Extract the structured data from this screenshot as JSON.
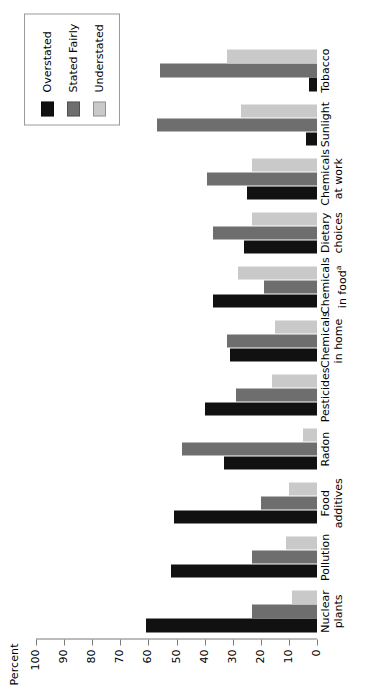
{
  "chart_data": {
    "type": "bar",
    "title": "",
    "subtitle": "",
    "xlabel": "",
    "ylabel": "Percent",
    "ylim": [
      0,
      100
    ],
    "ytick_labels": [
      "0",
      "10",
      "20",
      "30",
      "40",
      "50",
      "60",
      "70",
      "80",
      "90",
      "100"
    ],
    "ytick_values": [
      0,
      10,
      20,
      30,
      40,
      50,
      60,
      70,
      80,
      90,
      100
    ],
    "grid": false,
    "orientation": "vertical-bars-rotated-90ccw",
    "legend_position": "top-right",
    "categories": [
      "Nuclear\nplants",
      "Pollution",
      "Food\nadditives",
      "Radon",
      "Pesticides",
      "Chemicals\nin home",
      "Chemicals\nin foodᵃ",
      "Dietary\nchoices",
      "Chemicals\nat work",
      "Sunlight",
      "Tobacco"
    ],
    "category_lines": [
      [
        "Nuclear",
        "plants"
      ],
      [
        "Pollution",
        ""
      ],
      [
        "Food",
        "additives"
      ],
      [
        "Radon",
        ""
      ],
      [
        "Pesticides",
        ""
      ],
      [
        "Chemicals",
        "in home"
      ],
      [
        "Chemicals",
        "in food"
      ],
      [
        "Dietary",
        "choices"
      ],
      [
        "Chemicals",
        "at work"
      ],
      [
        "Sunlight",
        ""
      ],
      [
        "Tobacco",
        ""
      ]
    ],
    "footnote_marker_category_index": 6,
    "footnote_marker": "a",
    "series": [
      {
        "name": "Overstated",
        "color": "#111111",
        "values": [
          61,
          52,
          51,
          33,
          40,
          31,
          37,
          26,
          25,
          4,
          3
        ]
      },
      {
        "name": "Stated Fairly",
        "color": "#6e6e6e",
        "values": [
          23,
          23,
          20,
          48,
          29,
          32,
          19,
          37,
          39,
          57,
          56
        ]
      },
      {
        "name": "Understated",
        "color": "#c9c9c9",
        "values": [
          9,
          11,
          10,
          5,
          16,
          15,
          28,
          23,
          23,
          27,
          32
        ]
      }
    ]
  },
  "legend": {
    "items": [
      {
        "label": "Overstated",
        "swatch": "overstated"
      },
      {
        "label": "Stated Fairly",
        "swatch": "stated"
      },
      {
        "label": "Understated",
        "swatch": "understated"
      }
    ]
  },
  "axis": {
    "y_title": "Percent"
  }
}
